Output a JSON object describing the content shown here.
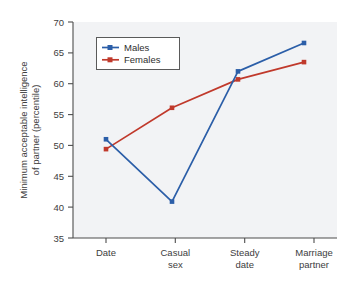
{
  "chart_data": {
    "type": "line",
    "title": "",
    "xlabel": "",
    "ylabel": "Minimum acceptable intelligence of partner (percentile)",
    "ylabel_line1": "Minimum acceptable intelligence",
    "ylabel_line2": "of partner (percentile)",
    "categories": [
      "Date",
      "Casual sex",
      "Steady date",
      "Marriage partner"
    ],
    "category_lines": [
      [
        "Date",
        ""
      ],
      [
        "Casual",
        "sex"
      ],
      [
        "Steady",
        "date"
      ],
      [
        "Marriage",
        "partner"
      ]
    ],
    "series": [
      {
        "name": "Males",
        "color": "#2b5ea8",
        "values": [
          51.0,
          40.9,
          62.0,
          66.6
        ]
      },
      {
        "name": "Females",
        "color": "#c0392b",
        "values": [
          49.4,
          56.1,
          60.7,
          63.5
        ]
      }
    ],
    "ylim": [
      35,
      70
    ],
    "yticks": [
      35,
      40,
      45,
      50,
      55,
      60,
      65,
      70
    ],
    "ytick_labels": [
      "35",
      "40",
      "45",
      "50",
      "55",
      "60",
      "65",
      "70"
    ],
    "grid": false,
    "legend_position": "upper left",
    "legend_entries": [
      "Males",
      "Females"
    ],
    "plot_background": "#f2f3f5",
    "axis_color": "#4d4d4d"
  }
}
